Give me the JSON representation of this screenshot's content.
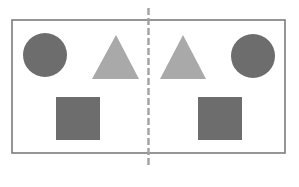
{
  "diagram": {
    "colors": {
      "background": "#ffffff",
      "frame": "#7c7c7c",
      "axis": "#a0a0a0",
      "dark_shape": "#6d6d6d",
      "light_shape": "#a9a9a9"
    },
    "frame": {
      "x": 12,
      "y": 20,
      "width": 273,
      "height": 133
    },
    "axis": {
      "x": 148.5,
      "y1": 8,
      "y2": 167,
      "style": "dashed"
    },
    "left_half": {
      "shapes": [
        {
          "type": "circle",
          "name": "circle",
          "cx": 45,
          "cy": 55,
          "r": 22,
          "fill": "dark"
        },
        {
          "type": "triangle",
          "name": "triangle",
          "points": "116,35 139,79 92,79",
          "fill": "light"
        },
        {
          "type": "square",
          "name": "square",
          "x": 56,
          "y": 97,
          "width": 44,
          "height": 43,
          "fill": "dark"
        }
      ]
    },
    "right_half": {
      "shapes": [
        {
          "type": "triangle",
          "name": "triangle",
          "points": "183,35 206,79 160,79",
          "fill": "light"
        },
        {
          "type": "circle",
          "name": "circle",
          "cx": 253,
          "cy": 56,
          "r": 22,
          "fill": "dark"
        },
        {
          "type": "square",
          "name": "square",
          "x": 198,
          "y": 97,
          "width": 44,
          "height": 43,
          "fill": "dark"
        }
      ]
    }
  }
}
